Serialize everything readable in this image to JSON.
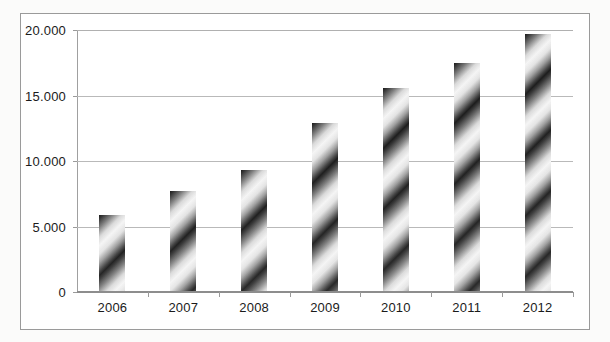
{
  "chart_data": {
    "type": "bar",
    "title": "",
    "subtitle": "",
    "xlabel": "",
    "ylabel": "",
    "categories": [
      "2006",
      "2007",
      "2008",
      "2009",
      "2010",
      "2011",
      "2012"
    ],
    "values": [
      5900,
      7700,
      9300,
      12900,
      15600,
      17500,
      19700
    ],
    "series": [
      {
        "name": "",
        "values": [
          5900,
          7700,
          9300,
          12900,
          15600,
          17500,
          19700
        ]
      }
    ],
    "ylim": [
      0,
      20000
    ],
    "ytick_values": [
      0,
      5000,
      10000,
      15000,
      20000
    ],
    "ytick_labels": [
      "0",
      "5.000",
      "10.000",
      "15.000",
      "20.000"
    ],
    "grid": true,
    "grid_axis": "y",
    "legend": false,
    "legend_position": "none",
    "bar_fill": "diagonal-stripe-gradient",
    "bar_color": "#2b2b2b",
    "grid_color": "#b9b9b9",
    "axis_color": "#8d8d8d",
    "frame_color": "#9a9a9a",
    "background_color": "#ffffff",
    "annotations": []
  },
  "figure": {
    "frame_label": "chart-frame",
    "plot_label": "plot-area"
  }
}
